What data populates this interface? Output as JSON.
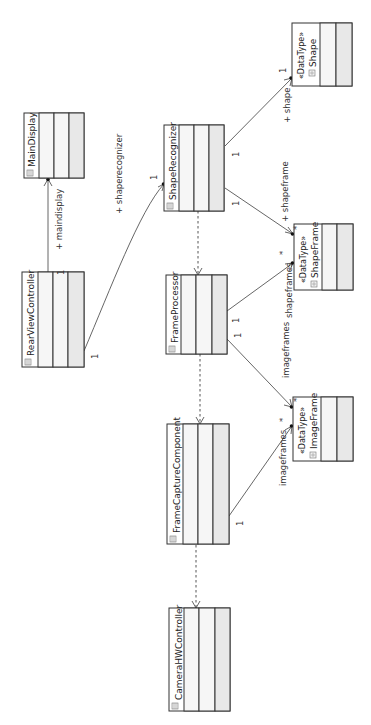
{
  "diagram": {
    "type": "UML class diagram",
    "orientation": "rotated 90 degrees counter-clockwise",
    "colors": {
      "box_border": "#333333",
      "compartment_light": "#f6f6f6",
      "compartment_dark": "#e8e8e8",
      "line": "#555555",
      "text": "#222222"
    },
    "classes": [
      {
        "id": "maindisplay",
        "name": "MainDisplay",
        "stereotype": "",
        "icon": "class-icon"
      },
      {
        "id": "rearviewcontroller",
        "name": "RearViewController",
        "stereotype": "",
        "icon": "class-icon"
      },
      {
        "id": "shaperecognizer",
        "name": "ShapeRecognizer",
        "stereotype": "",
        "icon": "class-icon"
      },
      {
        "id": "frameprocessor",
        "name": "FrameProcessor",
        "stereotype": "",
        "icon": "class-icon"
      },
      {
        "id": "framecapturecomponent",
        "name": "FrameCaptureComponent",
        "stereotype": "",
        "icon": "class-icon"
      },
      {
        "id": "camerahwcontroller",
        "name": "CameraHWController",
        "stereotype": "",
        "icon": "class-icon"
      },
      {
        "id": "shape",
        "name": "Shape",
        "stereotype": "«DataType»",
        "icon": "datatype-icon"
      },
      {
        "id": "shapeframe",
        "name": "ShapeFrame",
        "stereotype": "«DataType»",
        "icon": "datatype-icon"
      },
      {
        "id": "imageframe",
        "name": "ImageFrame",
        "stereotype": "«DataType»",
        "icon": "datatype-icon"
      }
    ],
    "associations": [
      {
        "from": "RearViewController",
        "to": "MainDisplay",
        "role": "+ maindisplay",
        "source_mult": "1",
        "target_mult": ""
      },
      {
        "from": "RearViewController",
        "to": "ShapeRecognizer",
        "role": "+ shaperecognizer",
        "source_mult": "1",
        "target_mult": "1"
      },
      {
        "from": "ShapeRecognizer",
        "to": "Shape",
        "role": "+ shape",
        "source_mult": "1",
        "target_mult": "1"
      },
      {
        "from": "ShapeRecognizer",
        "to": "ShapeFrame",
        "role": "+ shapeframe",
        "source_mult": "1",
        "target_mult": "*"
      },
      {
        "from": "FrameProcessor",
        "to": "ShapeFrame",
        "role": "shapeframes",
        "source_mult": "1",
        "target_mult": "*"
      },
      {
        "from": "FrameProcessor",
        "to": "ImageFrame",
        "role": "imageframes",
        "source_mult": "1",
        "target_mult": "*"
      },
      {
        "from": "FrameCaptureComponent",
        "to": "ImageFrame",
        "role": "imageframes",
        "source_mult": "1",
        "target_mult": "*"
      }
    ],
    "dependencies": [
      {
        "from": "ShapeRecognizer",
        "to": "FrameProcessor"
      },
      {
        "from": "FrameProcessor",
        "to": "FrameCaptureComponent"
      },
      {
        "from": "FrameCaptureComponent",
        "to": "CameraHWController"
      }
    ]
  },
  "labels": {
    "maindisplay_role": "+ maindisplay",
    "shaperecognizer_role": "+ shaperecognizer",
    "shape_role": "+ shape",
    "shapeframe_role": "+ shapeframe",
    "shapeframes_role": "shapeframes",
    "imageframes_role_fp": "imageframes",
    "imageframes_role_fcc": "imageframes",
    "one": "1",
    "many": "*"
  },
  "names": {
    "maindisplay": "MainDisplay",
    "rearviewcontroller": "RearViewController",
    "shaperecognizer": "ShapeRecognizer",
    "frameprocessor": "FrameProcessor",
    "framecapturecomponent": "FrameCaptureComponent",
    "camerahwcontroller": "CameraHWController",
    "shape": "Shape",
    "shapeframe": "ShapeFrame",
    "imageframe": "ImageFrame",
    "datatype_stereotype": "«DataType»"
  }
}
